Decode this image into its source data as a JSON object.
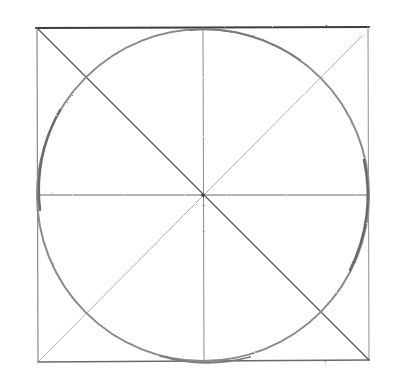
{
  "drawing": {
    "description": "Pencil construction sketch: square with inscribed circle, diagonals, and center cross lines",
    "colors": {
      "background": "#ffffff",
      "stroke_dark": "#4a4a4a",
      "stroke_mid": "#7a7a7a",
      "stroke_light": "#b0b0b0"
    },
    "square": {
      "x1": 37,
      "y1": 28,
      "x2": 369,
      "y2": 361
    },
    "center": {
      "x": 203,
      "y": 195
    },
    "circle": {
      "cx": 203,
      "cy": 195,
      "r": 166
    }
  }
}
